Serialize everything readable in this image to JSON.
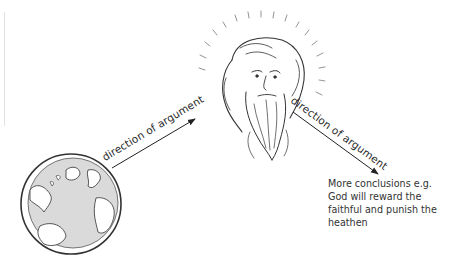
{
  "diagram": {
    "nodes": [
      {
        "id": "earth",
        "label": "",
        "icon": "globe-icon",
        "description": "Hand-drawn globe showing the Atlantic Ocean, Americas, Europe and Africa"
      },
      {
        "id": "god",
        "label": "",
        "icon": "bearded-god-head-icon",
        "description": "Hand-drawn bearded head with radiating halo"
      },
      {
        "id": "conclusion",
        "label": "More conclusions e.g. God will reward the faithful and punish the heathen"
      }
    ],
    "edges": [
      {
        "from": "earth",
        "to": "god",
        "label": "direction of argument"
      },
      {
        "from": "god",
        "to": "conclusion",
        "label": "direction of argument"
      }
    ],
    "conclusion_lines": [
      "More conclusions e.g.",
      "God will reward the",
      "faithful and punish the",
      "heathen"
    ],
    "colors": {
      "line": "#2b2b2b",
      "land": "#ffffff",
      "ocean": "#d9d9d9",
      "text": "#333333"
    }
  }
}
